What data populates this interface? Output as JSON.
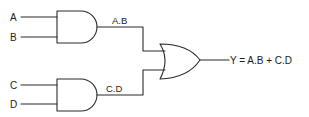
{
  "diagram": {
    "type": "logic-circuit",
    "inputs": [
      {
        "id": "A",
        "label": "A"
      },
      {
        "id": "B",
        "label": "B"
      },
      {
        "id": "C",
        "label": "C"
      },
      {
        "id": "D",
        "label": "D"
      }
    ],
    "gates": [
      {
        "id": "and1",
        "type": "AND",
        "inputs": [
          "A",
          "B"
        ],
        "output_label": "A.B"
      },
      {
        "id": "and2",
        "type": "AND",
        "inputs": [
          "C",
          "D"
        ],
        "output_label": "C.D"
      },
      {
        "id": "or1",
        "type": "OR",
        "inputs": [
          "and1",
          "and2"
        ],
        "output_label": "Y = A.B + C.D"
      }
    ],
    "output_expression": "Y = A.B + C.D",
    "colors": {
      "stroke": "#2a2a2a",
      "background": "#ffffff"
    }
  }
}
